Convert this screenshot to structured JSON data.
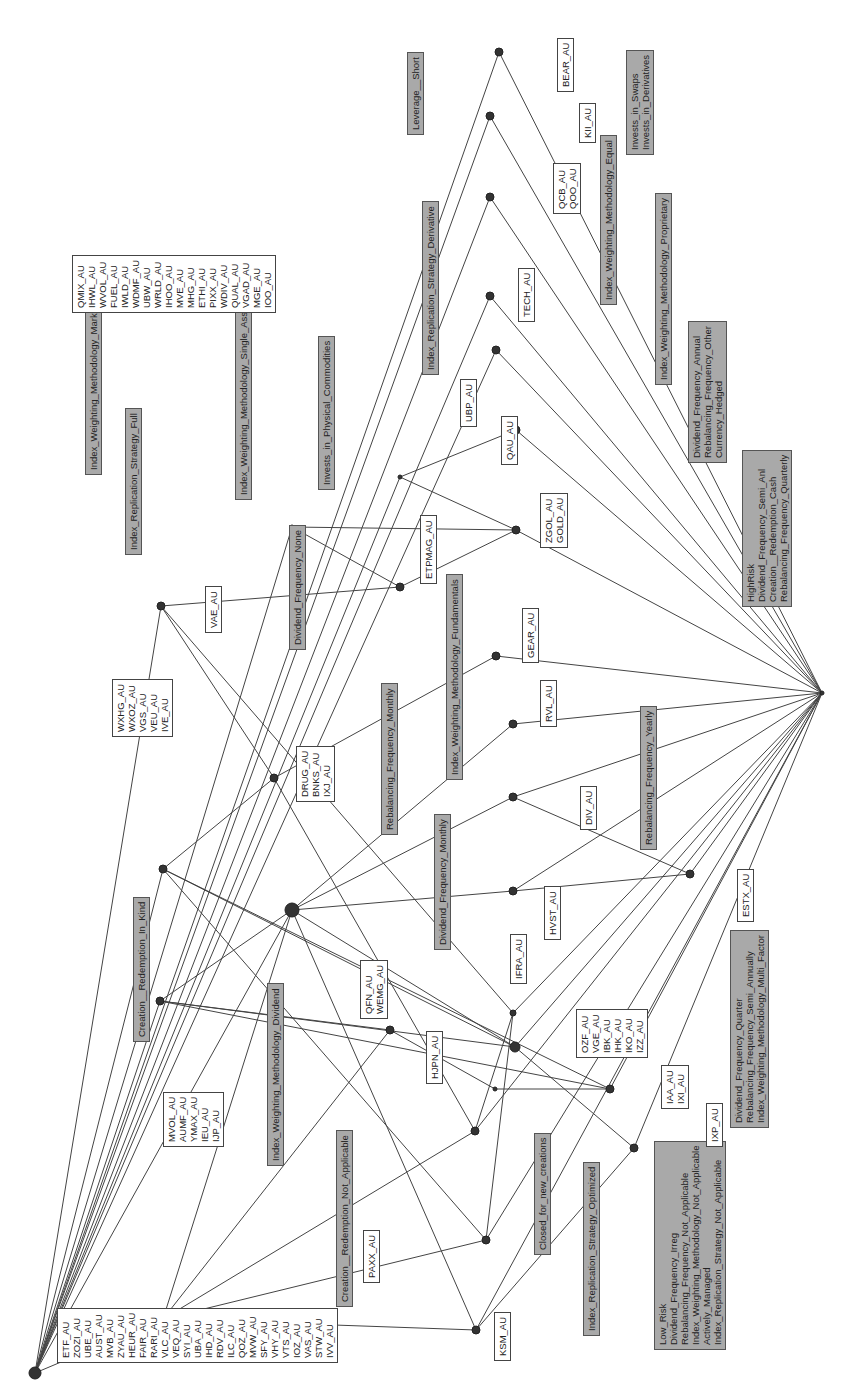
{
  "diagram": {
    "type": "concept-lattice",
    "orientation": "rotated-90",
    "colors": {
      "attribute_box": "#a9a9a9",
      "object_box": "#ffffff",
      "edge": "#444444",
      "node": "#333333"
    },
    "attribute_labels": [
      {
        "id": "a1",
        "lines": [
          "Index_Weighting_Methodology_Market_Cap"
        ],
        "x": 85,
        "y": 475
      },
      {
        "id": "a2",
        "lines": [
          "Creation__Redemption_In_Kind"
        ],
        "x": 133,
        "y": 1042
      },
      {
        "id": "a3",
        "lines": [
          "Index_Weighting_Methodology_Dividend"
        ],
        "x": 267,
        "y": 1166
      },
      {
        "id": "a4",
        "lines": [
          "Creation__Redemption_Not_Applicable"
        ],
        "x": 336,
        "y": 1307
      },
      {
        "id": "a5",
        "lines": [
          "Closed_for_new_creations"
        ],
        "x": 534,
        "y": 1255
      },
      {
        "id": "a6",
        "lines": [
          "Index_Replication_Strategy_Optimized"
        ],
        "x": 583,
        "y": 1336
      },
      {
        "id": "a7",
        "lines": [
          "Low_Risk",
          "Dividend_Frequency_Irreg",
          "Rebalancing_Frequency_Not_Applicable",
          "Index_Weighting_Methodology_Not_Applicable",
          "Actively_Managed",
          "Index_Replication_Strategy_Not_Applicable"
        ],
        "x": 654,
        "y": 1350
      },
      {
        "id": "a8",
        "lines": [
          "Dividend_Frequency_Quarter",
          "Rebalancing_Frequency_Semi_Annually",
          "Index_Weighting_Methodology_Multi_Factor"
        ],
        "x": 730,
        "y": 1128
      },
      {
        "id": "a9",
        "lines": [
          "Rebalancing_Frequency_Yearly"
        ],
        "x": 640,
        "y": 850
      },
      {
        "id": "a10",
        "lines": [
          "Dividend_Frequency_Monthly"
        ],
        "x": 434,
        "y": 950
      },
      {
        "id": "a11",
        "lines": [
          "Rebalancing_Frequency_Monthly"
        ],
        "x": 381,
        "y": 835
      },
      {
        "id": "a12",
        "lines": [
          "Index_Weighting_Methodology_Fundamentals"
        ],
        "x": 446,
        "y": 780
      },
      {
        "id": "a13",
        "lines": [
          "Dividend_Frequency_None"
        ],
        "x": 289,
        "y": 650
      },
      {
        "id": "a14",
        "lines": [
          "Index_Weighting_Methodology_Single_Asset"
        ],
        "x": 235,
        "y": 500
      },
      {
        "id": "a15",
        "lines": [
          "Invests_in_Physical_Commodities"
        ],
        "x": 318,
        "y": 490
      },
      {
        "id": "a16",
        "lines": [
          "Index_Replication_Strategy_Full"
        ],
        "x": 125,
        "y": 555
      },
      {
        "id": "a17",
        "lines": [
          "Index_Replication_Strategy_Derivative"
        ],
        "x": 422,
        "y": 375
      },
      {
        "id": "a18",
        "lines": [
          "Leverage__Short"
        ],
        "x": 407,
        "y": 135
      },
      {
        "id": "a19",
        "lines": [
          "Index_Weighting_Methodology_Equal"
        ],
        "x": 600,
        "y": 305
      },
      {
        "id": "a20",
        "lines": [
          "Index_Weighting_Methodology_Proprietary"
        ],
        "x": 655,
        "y": 385
      },
      {
        "id": "a21",
        "lines": [
          "Invests_in_Swaps",
          "Invests_in_Derivatives"
        ],
        "x": 626,
        "y": 155
      },
      {
        "id": "a22",
        "lines": [
          "Dividend_Frequency_Annual",
          "Rebalancing_Frequency_Other",
          "Currency_Hedged"
        ],
        "x": 688,
        "y": 463
      },
      {
        "id": "a23",
        "lines": [
          "HighRisk",
          "Dividend_Frequency_Semi_Anl",
          "Creation__Redemption_Cash",
          "Rebalancing_Frequency_Quarterly"
        ],
        "x": 742,
        "y": 607
      }
    ],
    "object_labels": [
      {
        "id": "o1",
        "lines": [
          "ETF_AU",
          "ZOZI_AU",
          "UBE_AU",
          "AUST_AU",
          "MVB_AU",
          "ZYAU_AU",
          "HEUR_AU",
          "FAIR_AU",
          "RARI_AU",
          "VLC_AU",
          "VEQ_AU",
          "SYI_AU",
          "UBA_AU",
          "IHD_AU",
          "RDV_AU",
          "ILC_AU",
          "QOZ_AU",
          "MVW_AU",
          "SFY_AU",
          "VHY_AU",
          "VTS_AU",
          "IOZ_AU",
          "VAS_AU",
          "STW_AU",
          "IVV_AU"
        ],
        "x": 57,
        "y": 1363
      },
      {
        "id": "o2",
        "lines": [
          "MVOL_AU",
          "AUMF_AU",
          "YMAX_AU",
          "IEU_AU",
          "IJP_AU"
        ],
        "x": 163,
        "y": 1147
      },
      {
        "id": "o3",
        "lines": [
          "PAXX_AU"
        ],
        "x": 363,
        "y": 1283
      },
      {
        "id": "o4",
        "lines": [
          "KSM_AU"
        ],
        "x": 494,
        "y": 1361
      },
      {
        "id": "o5",
        "lines": [
          "HJPN_AU"
        ],
        "x": 426,
        "y": 1084
      },
      {
        "id": "o6",
        "lines": [
          "QFN_AU",
          "WEMG_AU"
        ],
        "x": 360,
        "y": 1019
      },
      {
        "id": "o7",
        "lines": [
          "IFRA_AU"
        ],
        "x": 510,
        "y": 984
      },
      {
        "id": "o8",
        "lines": [
          "OZF_AU",
          "VGE_AU",
          "IBK_AU",
          "IHK_AU",
          "IKO_AU",
          "IZZ_AU"
        ],
        "x": 576,
        "y": 1058
      },
      {
        "id": "o9",
        "lines": [
          "IAA_AU",
          "IXI_AU"
        ],
        "x": 661,
        "y": 1109
      },
      {
        "id": "o10",
        "lines": [
          "IXP_AU"
        ],
        "x": 706,
        "y": 1147
      },
      {
        "id": "o11",
        "lines": [
          "HVST_AU"
        ],
        "x": 544,
        "y": 940
      },
      {
        "id": "o12",
        "lines": [
          "ESTX_AU"
        ],
        "x": 737,
        "y": 922
      },
      {
        "id": "o13",
        "lines": [
          "DIV_AU"
        ],
        "x": 580,
        "y": 830
      },
      {
        "id": "o14",
        "lines": [
          "RVL_AU"
        ],
        "x": 540,
        "y": 727
      },
      {
        "id": "o15",
        "lines": [
          "GEAR_AU"
        ],
        "x": 522,
        "y": 663
      },
      {
        "id": "o16",
        "lines": [
          "DRUG_AU",
          "BNKS_AU",
          "IXJ_AU"
        ],
        "x": 296,
        "y": 802
      },
      {
        "id": "o17",
        "lines": [
          "WXHG_AU",
          "WXOZ_AU",
          "VGS_AU",
          "VEU_AU",
          "IVE_AU"
        ],
        "x": 112,
        "y": 737
      },
      {
        "id": "o18",
        "lines": [
          "VAE_AU"
        ],
        "x": 205,
        "y": 633
      },
      {
        "id": "o19",
        "lines": [
          "ETPMAG_AU"
        ],
        "x": 420,
        "y": 584
      },
      {
        "id": "o20",
        "lines": [
          "ZGOL_AU",
          "GOLD_AU"
        ],
        "x": 540,
        "y": 548
      },
      {
        "id": "o21",
        "lines": [
          "QAU_AU"
        ],
        "x": 501,
        "y": 465
      },
      {
        "id": "o22",
        "lines": [
          "UBP_AU"
        ],
        "x": 460,
        "y": 427
      },
      {
        "id": "o23",
        "lines": [
          "TECH_AU"
        ],
        "x": 518,
        "y": 322
      },
      {
        "id": "o24",
        "lines": [
          "QCB_AU",
          "QOO_AU"
        ],
        "x": 553,
        "y": 214
      },
      {
        "id": "o25",
        "lines": [
          "KII_AU"
        ],
        "x": 579,
        "y": 143
      },
      {
        "id": "o26",
        "lines": [
          "BEAR_AU"
        ],
        "x": 557,
        "y": 92
      },
      {
        "id": "o27",
        "lines": [
          "QMIX_AU",
          "IHWL_AU",
          "WVOL_AU",
          "FUEL_AU",
          "IWLD_AU",
          "WDMF_AU",
          "UBW_AU",
          "WRLD_AU",
          "IHOO_AU",
          "MVE_AU",
          "MHG_AU",
          "ETHI_AU",
          "PIXX_AU",
          "WDIV_AU",
          "QUAL_AU",
          "VGAD_AU",
          "MGE_AU",
          "IOO_AU"
        ],
        "x": 72,
        "y": 313
      }
    ],
    "nodes": [
      {
        "id": "top",
        "x": 35,
        "y": 1373,
        "r": 6
      },
      {
        "id": "n1",
        "x": 163,
        "y": 1319,
        "r": 4
      },
      {
        "id": "n2",
        "x": 476,
        "y": 1330,
        "r": 4
      },
      {
        "id": "n3",
        "x": 486,
        "y": 1240,
        "r": 4
      },
      {
        "id": "n4",
        "x": 475,
        "y": 1131,
        "r": 4
      },
      {
        "id": "n5",
        "x": 160,
        "y": 1001,
        "r": 4
      },
      {
        "id": "n6",
        "x": 163,
        "y": 869,
        "r": 4
      },
      {
        "id": "n7",
        "x": 292,
        "y": 910,
        "r": 7
      },
      {
        "id": "n8",
        "x": 390,
        "y": 1030,
        "r": 4
      },
      {
        "id": "n9",
        "x": 515,
        "y": 1047,
        "r": 5
      },
      {
        "id": "n10",
        "x": 513,
        "y": 1013,
        "r": 3
      },
      {
        "id": "n11",
        "x": 495,
        "y": 1089,
        "r": 2
      },
      {
        "id": "n12",
        "x": 610,
        "y": 1089,
        "r": 4
      },
      {
        "id": "n13",
        "x": 634,
        "y": 1148,
        "r": 4
      },
      {
        "id": "n14",
        "x": 274,
        "y": 778,
        "r": 4
      },
      {
        "id": "n15",
        "x": 513,
        "y": 891,
        "r": 4
      },
      {
        "id": "n16",
        "x": 513,
        "y": 797,
        "r": 4
      },
      {
        "id": "n17",
        "x": 513,
        "y": 724,
        "r": 4
      },
      {
        "id": "n18",
        "x": 690,
        "y": 874,
        "r": 4
      },
      {
        "id": "n19",
        "x": 496,
        "y": 656,
        "r": 4
      },
      {
        "id": "n20",
        "x": 161,
        "y": 606,
        "r": 4
      },
      {
        "id": "n21",
        "x": 292,
        "y": 527,
        "r": 2
      },
      {
        "id": "n22",
        "x": 400,
        "y": 477,
        "r": 2
      },
      {
        "id": "n23",
        "x": 400,
        "y": 587,
        "r": 4
      },
      {
        "id": "n24",
        "x": 516,
        "y": 530,
        "r": 4
      },
      {
        "id": "n25",
        "x": 516,
        "y": 430,
        "r": 4
      },
      {
        "id": "n26",
        "x": 496,
        "y": 350,
        "r": 4
      },
      {
        "id": "n27",
        "x": 490,
        "y": 296,
        "r": 4
      },
      {
        "id": "n28",
        "x": 490,
        "y": 197,
        "r": 4
      },
      {
        "id": "n29",
        "x": 490,
        "y": 116,
        "r": 4
      },
      {
        "id": "n30",
        "x": 499,
        "y": 52,
        "r": 4
      },
      {
        "id": "bottom",
        "x": 822,
        "y": 693,
        "r": 2
      }
    ],
    "edges": [
      [
        "top",
        "n1"
      ],
      [
        "top",
        "n5"
      ],
      [
        "top",
        "n6"
      ],
      [
        "top",
        "n7"
      ],
      [
        "top",
        "n20"
      ],
      [
        "top",
        "n21"
      ],
      [
        "top",
        "n22"
      ],
      [
        "top",
        "n28"
      ],
      [
        "top",
        "n29"
      ],
      [
        "top",
        "n30"
      ],
      [
        "top",
        "n26"
      ],
      [
        "top",
        "n27"
      ],
      [
        "n1",
        "n2"
      ],
      [
        "n1",
        "n3"
      ],
      [
        "n1",
        "n4"
      ],
      [
        "n1",
        "n8"
      ],
      [
        "n1",
        "n7"
      ],
      [
        "n5",
        "n8"
      ],
      [
        "n5",
        "n9"
      ],
      [
        "n5",
        "n12"
      ],
      [
        "n5",
        "n7"
      ],
      [
        "n6",
        "n14"
      ],
      [
        "n6",
        "n9"
      ],
      [
        "n6",
        "n12"
      ],
      [
        "n6",
        "n3"
      ],
      [
        "n7",
        "n15"
      ],
      [
        "n7",
        "n16"
      ],
      [
        "n7",
        "n17"
      ],
      [
        "n7",
        "n9"
      ],
      [
        "n7",
        "n2"
      ],
      [
        "n20",
        "n14"
      ],
      [
        "n20",
        "n10"
      ],
      [
        "n20",
        "n23"
      ],
      [
        "n14",
        "n19"
      ],
      [
        "n14",
        "n4"
      ],
      [
        "n21",
        "n23"
      ],
      [
        "n21",
        "n24"
      ],
      [
        "n22",
        "n24"
      ],
      [
        "n22",
        "n25"
      ],
      [
        "n23",
        "n24"
      ],
      [
        "n8",
        "n11"
      ],
      [
        "n11",
        "n12"
      ],
      [
        "n9",
        "n13"
      ],
      [
        "n2",
        "n13"
      ],
      [
        "n3",
        "n10"
      ],
      [
        "n4",
        "n10"
      ],
      [
        "n15",
        "bottom"
      ],
      [
        "n16",
        "bottom"
      ],
      [
        "n17",
        "bottom"
      ],
      [
        "n18",
        "bottom"
      ],
      [
        "n19",
        "bottom"
      ],
      [
        "n24",
        "bottom"
      ],
      [
        "n25",
        "bottom"
      ],
      [
        "n26",
        "bottom"
      ],
      [
        "n27",
        "bottom"
      ],
      [
        "n28",
        "bottom"
      ],
      [
        "n29",
        "bottom"
      ],
      [
        "n30",
        "bottom"
      ],
      [
        "n10",
        "bottom"
      ],
      [
        "n12",
        "bottom"
      ],
      [
        "n13",
        "bottom"
      ],
      [
        "n9",
        "bottom"
      ],
      [
        "n2",
        "bottom"
      ],
      [
        "n3",
        "bottom"
      ],
      [
        "n4",
        "bottom"
      ],
      [
        "n16",
        "n18"
      ],
      [
        "n15",
        "n18"
      ]
    ]
  }
}
